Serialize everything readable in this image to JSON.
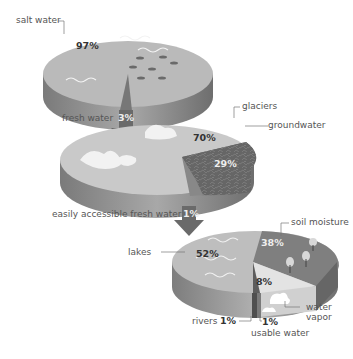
{
  "diagram": {
    "levels": [
      {
        "name": "all water",
        "segments": [
          {
            "label": "salt water",
            "value": "97%"
          },
          {
            "label": "fresh water",
            "value": "3%"
          }
        ]
      },
      {
        "name": "fresh water",
        "segments": [
          {
            "label": "glaciers",
            "value": "70%"
          },
          {
            "label": "groundwater",
            "value": "29%"
          },
          {
            "label": "easily accessible fresh water",
            "value": "1%"
          }
        ]
      },
      {
        "name": "easily accessible fresh water",
        "segments": [
          {
            "label": "lakes",
            "value": "52%"
          },
          {
            "label": "soil moisture",
            "value": "38%"
          },
          {
            "label": "water vapor",
            "value": "8%"
          },
          {
            "label": "rivers",
            "value": "1%"
          },
          {
            "label": "usable water",
            "value": "1%"
          }
        ]
      }
    ]
  },
  "labels": {
    "salt_water": "salt water",
    "salt_water_pct": "97%",
    "fresh_water": "fresh water",
    "fresh_water_pct": "3%",
    "glaciers": "glaciers",
    "glaciers_pct": "70%",
    "groundwater": "groundwater",
    "groundwater_pct": "29%",
    "accessible": "easily accessible fresh water",
    "accessible_pct": "1%",
    "soil_moisture": "soil moisture",
    "soil_moisture_pct": "38%",
    "lakes": "lakes",
    "lakes_pct": "52%",
    "water_vapor_pct": "8%",
    "water_vapor_1": "water",
    "water_vapor_2": "vapor",
    "rivers": "rivers",
    "rivers_pct": "1%",
    "usable_pct": "1%",
    "usable": "usable water"
  },
  "colors": {
    "salt_top": "#b9b9b9",
    "salt_side": "#8a8a8a",
    "arrow": "#6a6a6a",
    "glacier_top": "#c8c8c8",
    "ground_top": "#6f6f6f",
    "lakes_top": "#bdbdbd",
    "soil_top": "#808080",
    "vapor_top": "#e2e2e2"
  }
}
